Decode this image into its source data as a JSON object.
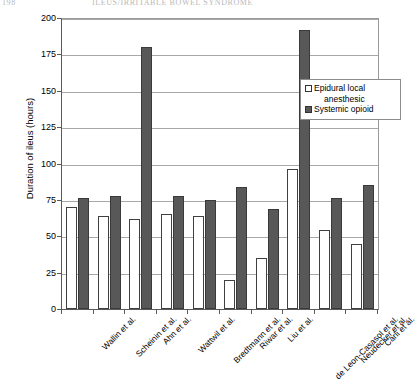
{
  "header": {
    "folio": "198",
    "running_head": "ILEUS/IRRITABLE BOWEL SYNDROME"
  },
  "legend": {
    "position": "inside-top-right",
    "entries": [
      {
        "label": "Epidural local",
        "label_cont": "anesthesic",
        "swatch": "white-square"
      },
      {
        "label": "Systemic opioid",
        "label_cont": "",
        "swatch": "dark-square"
      }
    ]
  },
  "chart_data": {
    "type": "bar",
    "title": "",
    "xlabel": "",
    "ylabel": "Duration of ileus (hours)",
    "ylim": [
      0,
      200
    ],
    "yticks": [
      0,
      25,
      50,
      75,
      100,
      125,
      150,
      175,
      200
    ],
    "grid": true,
    "categories": [
      "Wallin et al.",
      "Scheinin et al.",
      "Ahn et al.",
      "Wattwil et al.",
      "Bredtmann et al.",
      "Riwar et al.",
      "Liu et al.",
      "de Leon-Casasol et al.",
      "Neudecker et al.",
      "Carli et al."
    ],
    "series": [
      {
        "name": "Epidural local anesthesic",
        "color": "#ffffff",
        "values": [
          70,
          64,
          62,
          65,
          64,
          20,
          35,
          96,
          54,
          45
        ]
      },
      {
        "name": "Systemic opioid",
        "color": "#585858",
        "values": [
          76,
          78,
          180,
          78,
          75,
          84,
          69,
          192,
          76,
          85
        ]
      }
    ]
  }
}
